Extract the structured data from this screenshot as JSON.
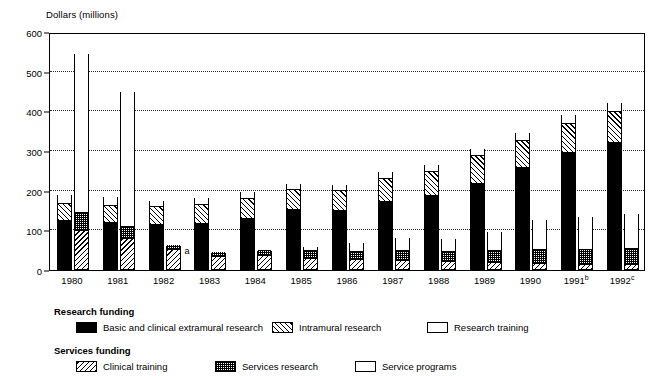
{
  "axis_title": "Dollars (millions)",
  "legend": {
    "research_heading": "Research funding",
    "services_heading": "Services funding",
    "items": [
      {
        "key": "extramural",
        "label": "Basic and clinical extramural research",
        "pattern": "solid-black"
      },
      {
        "key": "intramural",
        "label": "Intramural research",
        "pattern": "forward-hatch"
      },
      {
        "key": "training",
        "label": "Research training",
        "pattern": "light-stipple"
      },
      {
        "key": "clintrain",
        "label": "Clinical training",
        "pattern": "back-hatch"
      },
      {
        "key": "svcresearch",
        "label": "Services research",
        "pattern": "dense-checker"
      },
      {
        "key": "svcprograms",
        "label": "Service programs",
        "pattern": "white"
      }
    ]
  },
  "footnotes": {
    "a": "a",
    "b": "b",
    "c": "c"
  },
  "chart_data": {
    "type": "bar",
    "title": "",
    "subtitle": "",
    "xlabel": "",
    "ylabel": "Dollars (millions)",
    "ylim": [
      0,
      600
    ],
    "yticks": [
      0,
      100,
      200,
      300,
      400,
      500,
      600
    ],
    "grid": true,
    "legend_position": "below-plot",
    "stacked": true,
    "grouped": true,
    "categories": [
      "1980",
      "1981",
      "1982",
      "1983",
      "1984",
      "1985",
      "1986",
      "1987",
      "1988",
      "1989",
      "1990",
      "1991",
      "1992"
    ],
    "category_footnotes": {
      "1991": "b",
      "1992": "c"
    },
    "groups": [
      {
        "name": "Research funding",
        "series": [
          {
            "name": "Basic and clinical extramural research",
            "key": "extramural",
            "values": [
              120,
              115,
              112,
              113,
              127,
              148,
              145,
              170,
              185,
              215,
              255,
              293,
              317
            ]
          },
          {
            "name": "Intramural research",
            "key": "intramural",
            "values": [
              45,
              45,
              45,
              48,
              50,
              50,
              52,
              57,
              60,
              70,
              68,
              72,
              78
            ]
          },
          {
            "name": "Research training",
            "key": "training",
            "values": [
              25,
              25,
              17,
              20,
              20,
              18,
              18,
              20,
              20,
              20,
              22,
              25,
              25
            ]
          }
        ],
        "totals": [
          190,
          185,
          174,
          181,
          197,
          216,
          215,
          247,
          265,
          305,
          345,
          390,
          420
        ]
      },
      {
        "name": "Services funding",
        "series": [
          {
            "name": "Clinical training",
            "key": "clintrain",
            "values": [
              95,
              75,
              48,
              30,
              33,
              25,
              22,
              20,
              18,
              15,
              12,
              10,
              10
            ]
          },
          {
            "name": "Services research",
            "key": "svcresearch",
            "values": [
              45,
              30,
              12,
              12,
              15,
              20,
              22,
              25,
              25,
              30,
              35,
              38,
              40
            ]
          },
          {
            "name": "Service programs",
            "key": "svcprograms",
            "values": [
              405,
              345,
              0,
              0,
              0,
              12,
              25,
              35,
              36,
              50,
              80,
              85,
              90
            ]
          }
        ],
        "totals": [
          545,
          450,
          60,
          42,
          48,
          57,
          69,
          80,
          79,
          95,
          127,
          133,
          140
        ],
        "annotations": [
          {
            "category": "1982",
            "text": "a"
          }
        ]
      }
    ]
  }
}
